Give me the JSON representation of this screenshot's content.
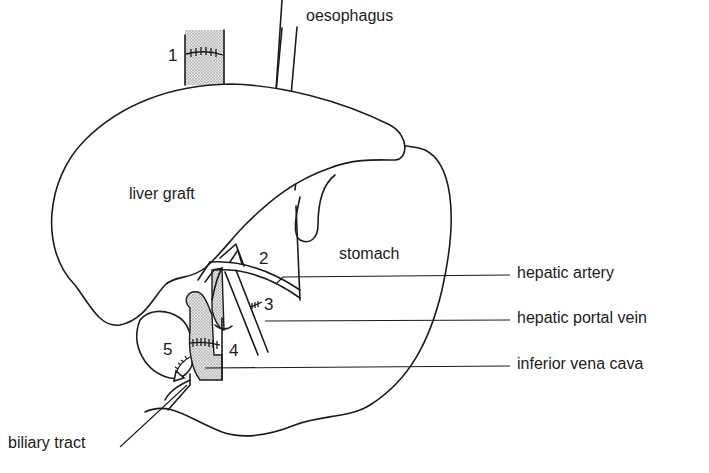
{
  "figure": {
    "type": "anatomical-diagram"
  },
  "labels": {
    "oesophagus": "oesophagus",
    "liver_graft": "liver graft",
    "stomach": "stomach",
    "hepatic_artery": "hepatic artery",
    "hepatic_portal_vein": "hepatic portal vein",
    "inferior_vena_cava": "inferior vena cava",
    "biliary_tract": "biliary tract"
  },
  "anastomosis_numbers": {
    "n1": "1",
    "n2": "2",
    "n3": "3",
    "n4": "4",
    "n5": "5"
  },
  "colors": {
    "line": "#1c1c1c",
    "background": "#ffffff",
    "stipple": "#9a9a9a"
  }
}
